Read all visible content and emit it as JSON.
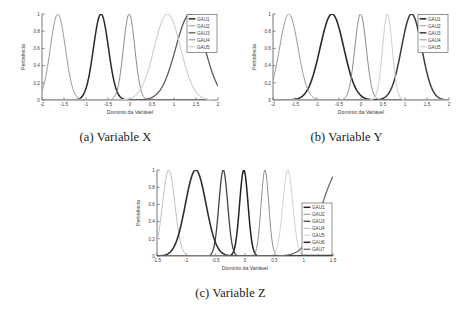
{
  "figure": {
    "background": "#ffffff",
    "axis_color": "#3a3a3a",
    "tick_font_size": 4.6,
    "label_font_size": 5.2
  },
  "panels": [
    {
      "id": "panel-a",
      "caption_tag": "(a)",
      "caption_text": "Variable X",
      "xlabel": "Domínio da Variável",
      "ylabel": "Pertinência"
    },
    {
      "id": "panel-b",
      "caption_tag": "(b)",
      "caption_text": "Variable Y",
      "xlabel": "Domínio da Variável",
      "ylabel": "Pertinência"
    },
    {
      "id": "panel-c",
      "caption_tag": "(c)",
      "caption_text": "Variable Z",
      "xlabel": "Domínio da Variável",
      "ylabel": "Pertinência"
    }
  ],
  "chart_data": [
    {
      "type": "line",
      "id": "variable-x",
      "title": "(a) Variable X",
      "xlabel": "Domínio da Variável",
      "ylabel": "Pertinência",
      "xlim": [
        -2,
        2
      ],
      "ylim": [
        0,
        1
      ],
      "xticks": [
        -2,
        -1.5,
        -1,
        -0.5,
        0,
        0.5,
        1,
        1.5,
        2
      ],
      "xticklabels": [
        "-2",
        "-1.5",
        "-1",
        "-0.5",
        "0",
        "0.5",
        "1",
        "1.5",
        "2"
      ],
      "yticks": [
        0,
        0.2,
        0.4,
        0.6,
        0.8,
        1
      ],
      "yticklabels": [
        "0",
        "0.2",
        "0.4",
        "0.6",
        "0.8",
        "1"
      ],
      "grid": false,
      "legend_position": "upper right",
      "legend_entries": [
        "GAU1",
        "GAU2",
        "GAU3",
        "GAU4",
        "GAU5"
      ],
      "series": [
        {
          "name": "GAU1",
          "curve": "gaussian",
          "mean": -0.66,
          "sigma": 0.17,
          "amplitude": 1,
          "color": "#2a2a2a",
          "width": 1.5
        },
        {
          "name": "GAU2",
          "curve": "gaussian",
          "mean": -1.64,
          "sigma": 0.17,
          "amplitude": 1,
          "color": "#9a9a9a",
          "width": 1.0
        },
        {
          "name": "GAU3",
          "curve": "gaussian",
          "mean": 1.37,
          "sigma": 0.33,
          "amplitude": 1,
          "color": "#5a5a5a",
          "width": 1.3
        },
        {
          "name": "GAU4",
          "curve": "gaussian",
          "mean": -0.02,
          "sigma": 0.13,
          "amplitude": 1,
          "color": "#8c8c8c",
          "width": 1.0
        },
        {
          "name": "GAU5",
          "curve": "gaussian",
          "mean": 0.85,
          "sigma": 0.3,
          "amplitude": 1,
          "color": "#d2d2d2",
          "width": 1.2
        }
      ]
    },
    {
      "type": "line",
      "id": "variable-y",
      "title": "(b) Variable Y",
      "xlabel": "Domínio da Variável",
      "ylabel": "Pertinência",
      "xlim": [
        -2,
        2
      ],
      "ylim": [
        0,
        1
      ],
      "xticks": [
        -2,
        -1.5,
        -1,
        -0.5,
        0,
        0.5,
        1,
        1.5,
        2
      ],
      "xticklabels": [
        "-2",
        "-1.5",
        "-1",
        "-0.5",
        "0",
        "0.5",
        "1",
        "1.5",
        "2"
      ],
      "yticks": [
        0,
        0.2,
        0.4,
        0.6,
        0.8,
        1
      ],
      "yticklabels": [
        "0",
        "0.2",
        "0.4",
        "0.6",
        "0.8",
        "1"
      ],
      "grid": false,
      "legend_position": "upper right",
      "legend_entries": [
        "GAU1",
        "GAU2",
        "GAU3",
        "GAU4",
        "GAU5"
      ],
      "series": [
        {
          "name": "GAU1",
          "curve": "gaussian",
          "mean": -0.66,
          "sigma": 0.27,
          "amplitude": 1,
          "color": "#2a2a2a",
          "width": 1.6
        },
        {
          "name": "GAU2",
          "curve": "gaussian",
          "mean": -1.64,
          "sigma": 0.21,
          "amplitude": 1,
          "color": "#9a9a9a",
          "width": 1.0
        },
        {
          "name": "GAU3",
          "curve": "gaussian",
          "mean": 1.15,
          "sigma": 0.23,
          "amplitude": 1,
          "color": "#3c3c3c",
          "width": 1.5
        },
        {
          "name": "GAU4",
          "curve": "gaussian",
          "mean": -0.01,
          "sigma": 0.13,
          "amplitude": 1,
          "color": "#8c8c8c",
          "width": 1.0
        },
        {
          "name": "GAU5",
          "curve": "gaussian",
          "mean": 0.6,
          "sigma": 0.11,
          "amplitude": 1,
          "color": "#d2d2d2",
          "width": 1.1
        }
      ]
    },
    {
      "type": "line",
      "id": "variable-z",
      "title": "(c) Variable Z",
      "xlabel": "Domínio da Variável",
      "ylabel": "Pertinência",
      "xlim": [
        -1.5,
        1.5
      ],
      "ylim": [
        0,
        1
      ],
      "xticks": [
        -1.5,
        -1,
        -0.5,
        0,
        0.5,
        1,
        1.5
      ],
      "xticklabels": [
        "-1.5",
        "-1",
        "-0.5",
        "0",
        "0.5",
        "1",
        "1.5"
      ],
      "yticks": [
        0,
        0.2,
        0.4,
        0.6,
        0.8,
        1
      ],
      "yticklabels": [
        "0",
        "0.2",
        "0.4",
        "0.6",
        "0.8",
        "1"
      ],
      "grid": false,
      "legend_position": "lower right",
      "legend_entries": [
        "GAU1",
        "GAU2",
        "GAU3",
        "GAU4",
        "GAU5",
        "GAU6",
        "GAU7"
      ],
      "series": [
        {
          "name": "GAU1",
          "curve": "gaussian",
          "mean": -0.02,
          "sigma": 0.072,
          "amplitude": 1,
          "color": "#222222",
          "width": 1.5
        },
        {
          "name": "GAU2",
          "curve": "gaussian",
          "mean": 0.34,
          "sigma": 0.065,
          "amplitude": 1,
          "color": "#8f8f8f",
          "width": 1.0
        },
        {
          "name": "GAU3",
          "curve": "gaussian",
          "mean": -0.37,
          "sigma": 0.075,
          "amplitude": 1,
          "color": "#454545",
          "width": 1.3
        },
        {
          "name": "GAU4",
          "curve": "gaussian",
          "mean": -1.3,
          "sigma": 0.105,
          "amplitude": 1,
          "color": "#c0c0c0",
          "width": 1.0
        },
        {
          "name": "GAU5",
          "curve": "gaussian",
          "mean": 0.73,
          "sigma": 0.085,
          "amplitude": 1,
          "color": "#d6d6d6",
          "width": 1.1
        },
        {
          "name": "GAU6",
          "curve": "gaussian",
          "mean": -0.84,
          "sigma": 0.175,
          "amplitude": 1,
          "color": "#2e2e2e",
          "width": 1.6
        },
        {
          "name": "GAU7",
          "curve": "gaussian",
          "mean": 1.62,
          "sigma": 0.3,
          "amplitude": 1,
          "color": "#6b6b6b",
          "width": 1.3
        }
      ]
    }
  ]
}
